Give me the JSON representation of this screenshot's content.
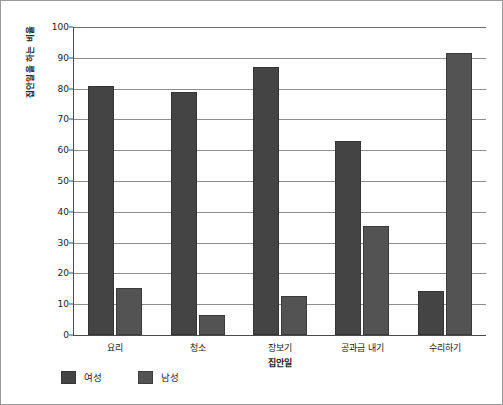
{
  "chart_data": {
    "type": "bar",
    "title": "",
    "xlabel": "집안일",
    "ylabel": "집안일을 하는 비율",
    "categories": [
      "요리",
      "청소",
      "장보기",
      "공과금 내기",
      "수리하기"
    ],
    "series": [
      {
        "name": "여성",
        "color": "#444444",
        "values": [
          81,
          79,
          87,
          63,
          14.3
        ]
      },
      {
        "name": "남성",
        "color": "#535353",
        "values": [
          15.3,
          6.5,
          12.7,
          35.5,
          91.5
        ]
      }
    ],
    "ylim": [
      0,
      100
    ],
    "y_ticks": [
      0,
      10,
      20,
      30,
      40,
      50,
      60,
      70,
      80,
      90,
      100
    ],
    "y_tick_labels": [
      "0",
      "10",
      "20",
      "30",
      "40",
      "50",
      "60",
      "70",
      "80",
      "90",
      "100"
    ],
    "grid": "horizontal",
    "legend_position": "bottom-left"
  },
  "legend": {
    "items": [
      {
        "label": "여성",
        "color": "#444444"
      },
      {
        "label": "남성",
        "color": "#535353"
      }
    ]
  }
}
